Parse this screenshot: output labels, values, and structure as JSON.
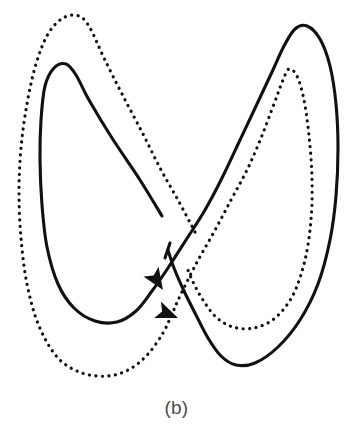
{
  "figure": {
    "caption": "(b)",
    "label": "butterfly-attractor-phase-portrait",
    "background_color": "#ffffff",
    "stroke_color": "#111111",
    "caption_color": "#4a4a4a",
    "width": 353,
    "height": 437
  },
  "chart_data": {
    "type": "line",
    "title": "",
    "subtitle": "",
    "xlabel": "",
    "ylabel": "",
    "grid": false,
    "legend_position": "none",
    "axis_visible": false,
    "tick_labels": [],
    "annotations": [
      {
        "text": "(b)",
        "x": 176,
        "y": 408,
        "role": "figure-caption"
      }
    ],
    "xlim": [
      0,
      353
    ],
    "ylim": [
      0,
      437
    ],
    "series": [
      {
        "name": "solid-orbit",
        "style": "solid",
        "color": "#111111",
        "line_width": 3.1,
        "closed": false,
        "arrowheads": 1,
        "extrema": {
          "left_lobe_top": [
            75,
            63
          ],
          "left_lobe_bottom": [
            117,
            322
          ],
          "right_lobe_top": [
            300,
            25
          ],
          "right_lobe_bottom": [
            238,
            365
          ],
          "left_edge": [
            40,
            200
          ],
          "right_edge": [
            338,
            170
          ]
        },
        "points": [
          [
            162,
            216
          ],
          [
            140,
            180
          ],
          [
            112,
            138
          ],
          [
            89,
            100
          ],
          [
            76,
            75
          ],
          [
            66,
            64
          ],
          [
            54,
            68
          ],
          [
            45,
            86
          ],
          [
            41,
            120
          ],
          [
            40,
            160
          ],
          [
            42,
            205
          ],
          [
            47,
            247
          ],
          [
            58,
            284
          ],
          [
            74,
            308
          ],
          [
            95,
            321
          ],
          [
            117,
            322
          ],
          [
            136,
            311
          ],
          [
            152,
            291
          ],
          [
            168,
            268
          ],
          [
            186,
            240
          ],
          [
            205,
            210
          ],
          [
            222,
            178
          ],
          [
            240,
            140
          ],
          [
            257,
            104
          ],
          [
            272,
            72
          ],
          [
            284,
            46
          ],
          [
            295,
            29
          ],
          [
            307,
            26
          ],
          [
            320,
            39
          ],
          [
            330,
            66
          ],
          [
            336,
            104
          ],
          [
            338,
            148
          ],
          [
            336,
            196
          ],
          [
            330,
            240
          ],
          [
            318,
            284
          ],
          [
            300,
            320
          ],
          [
            278,
            347
          ],
          [
            255,
            363
          ],
          [
            236,
            365
          ],
          [
            221,
            356
          ],
          [
            208,
            338
          ],
          [
            196,
            315
          ],
          [
            184,
            291
          ],
          [
            174,
            268
          ],
          [
            168,
            250
          ]
        ]
      },
      {
        "name": "dotted-orbit",
        "style": "dotted",
        "color": "#111111",
        "line_width": 3.2,
        "dot_diameter": 3.2,
        "dot_spacing": 6.4,
        "closed": false,
        "arrowheads": 1,
        "extrema": {
          "left_lobe_top": [
            80,
            15
          ],
          "left_lobe_bottom": [
            115,
            375
          ],
          "right_lobe_top": [
            288,
            68
          ],
          "right_lobe_bottom": [
            232,
            327
          ],
          "left_edge": [
            19,
            190
          ],
          "right_edge": [
            312,
            200
          ]
        },
        "points": [
          [
            195,
            232
          ],
          [
            178,
            200
          ],
          [
            160,
            168
          ],
          [
            142,
            132
          ],
          [
            122,
            94
          ],
          [
            104,
            58
          ],
          [
            90,
            28
          ],
          [
            79,
            16
          ],
          [
            63,
            18
          ],
          [
            48,
            34
          ],
          [
            36,
            64
          ],
          [
            27,
            104
          ],
          [
            21,
            148
          ],
          [
            19,
            192
          ],
          [
            21,
            238
          ],
          [
            27,
            284
          ],
          [
            39,
            326
          ],
          [
            58,
            358
          ],
          [
            82,
            373
          ],
          [
            108,
            376
          ],
          [
            130,
            369
          ],
          [
            148,
            354
          ],
          [
            163,
            333
          ],
          [
            172,
            314
          ],
          [
            180,
            296
          ],
          [
            196,
            264
          ],
          [
            214,
            232
          ],
          [
            231,
            200
          ],
          [
            247,
            170
          ],
          [
            261,
            138
          ],
          [
            274,
            104
          ],
          [
            283,
            80
          ],
          [
            289,
            69
          ],
          [
            297,
            76
          ],
          [
            304,
            100
          ],
          [
            309,
            136
          ],
          [
            312,
            178
          ],
          [
            311,
            220
          ],
          [
            305,
            260
          ],
          [
            293,
            295
          ],
          [
            275,
            318
          ],
          [
            254,
            328
          ],
          [
            233,
            327
          ],
          [
            216,
            317
          ],
          [
            203,
            300
          ],
          [
            193,
            282
          ],
          [
            186,
            265
          ]
        ]
      }
    ],
    "arrow_markers": [
      {
        "name": "solid-orbit-direction-arrow",
        "belongs_to": "solid-orbit",
        "tip": [
          163,
          290
        ],
        "angle_deg": 57,
        "length": 22,
        "half_width": 9
      },
      {
        "name": "dotted-orbit-direction-arrow",
        "belongs_to": "dotted-orbit",
        "tip": [
          178,
          318
        ],
        "angle_deg": 22,
        "length": 22,
        "half_width": 9
      }
    ],
    "solid_gap_segment": {
      "name": "solid-orbit-center-stub",
      "from": [
        170,
        243
      ],
      "to": [
        165,
        258
      ]
    }
  }
}
